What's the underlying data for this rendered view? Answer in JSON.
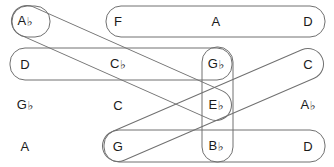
{
  "diagram": {
    "width": 334,
    "height": 167,
    "background": "#ffffff",
    "stroke_color": "#707070",
    "text_color": "#1a1a1a"
  },
  "grid": {
    "columns_x": [
      25,
      118,
      216,
      308
    ],
    "rows_y": [
      21,
      64,
      105,
      146
    ],
    "cells": [
      {
        "id": "r1c1",
        "label": "A♭",
        "text": "A",
        "accidental": "♭",
        "x": 25,
        "y": 21
      },
      {
        "id": "r1c2",
        "label": "F",
        "text": "F",
        "accidental": "",
        "x": 118,
        "y": 21
      },
      {
        "id": "r1c3",
        "label": "A",
        "text": "A",
        "accidental": "",
        "x": 216,
        "y": 21
      },
      {
        "id": "r1c4",
        "label": "D",
        "text": "D",
        "accidental": "",
        "x": 308,
        "y": 21
      },
      {
        "id": "r2c1",
        "label": "D",
        "text": "D",
        "accidental": "",
        "x": 25,
        "y": 64
      },
      {
        "id": "r2c2",
        "label": "C♭",
        "text": "C",
        "accidental": "♭",
        "x": 118,
        "y": 64
      },
      {
        "id": "r2c3",
        "label": "G♭",
        "text": "G",
        "accidental": "♭",
        "x": 216,
        "y": 64
      },
      {
        "id": "r2c4",
        "label": "C",
        "text": "C",
        "accidental": "",
        "x": 308,
        "y": 64
      },
      {
        "id": "r3c1",
        "label": "G♭",
        "text": "G",
        "accidental": "♭",
        "x": 25,
        "y": 105
      },
      {
        "id": "r3c2",
        "label": "C",
        "text": "C",
        "accidental": "",
        "x": 118,
        "y": 105
      },
      {
        "id": "r3c3",
        "label": "E♭",
        "text": "E",
        "accidental": "♭",
        "x": 216,
        "y": 105
      },
      {
        "id": "r3c4",
        "label": "A♭",
        "text": "A",
        "accidental": "♭",
        "x": 308,
        "y": 105
      },
      {
        "id": "r4c1",
        "label": "A",
        "text": "A",
        "accidental": "",
        "x": 25,
        "y": 146
      },
      {
        "id": "r4c2",
        "label": "G",
        "text": "G",
        "accidental": "",
        "x": 118,
        "y": 146
      },
      {
        "id": "r4c3",
        "label": "B♭",
        "text": "B",
        "accidental": "♭",
        "x": 216,
        "y": 146
      },
      {
        "id": "r4c4",
        "label": "D",
        "text": "D",
        "accidental": "",
        "x": 308,
        "y": 146
      }
    ]
  },
  "groupings": [
    {
      "id": "capsule-ab",
      "name": "capsule-row1-ab",
      "orientation": "single",
      "members": [
        "A♭"
      ],
      "shape": "rounded-rect",
      "x": 12,
      "y": 6,
      "w": 38,
      "h": 31,
      "r": 15
    },
    {
      "id": "capsule-f-a-d",
      "name": "capsule-row1-f-a-d",
      "orientation": "horizontal",
      "members": [
        "F",
        "A",
        "D"
      ],
      "shape": "rounded-rect",
      "x": 106,
      "y": 6,
      "w": 219,
      "h": 31,
      "r": 15
    },
    {
      "id": "capsule-d-cb-gb",
      "name": "capsule-row2-d-cb-gb",
      "orientation": "horizontal",
      "members": [
        "D",
        "C♭",
        "G♭"
      ],
      "shape": "rounded-rect",
      "x": 10,
      "y": 48,
      "w": 222,
      "h": 32,
      "r": 15
    },
    {
      "id": "capsule-g-bb-d",
      "name": "capsule-row4-g-bb-d",
      "orientation": "horizontal",
      "members": [
        "G",
        "B♭",
        "D"
      ],
      "shape": "rounded-rect",
      "x": 104,
      "y": 130,
      "w": 221,
      "h": 32,
      "r": 15
    },
    {
      "id": "capsule-gb-eb-bb",
      "name": "capsule-column-gb-eb-bb",
      "orientation": "vertical",
      "members": [
        "G♭",
        "E♭",
        "B♭"
      ],
      "shape": "rounded-rect",
      "x": 202,
      "y": 47,
      "w": 31,
      "h": 115,
      "r": 15
    },
    {
      "id": "capsule-diag-ab-eb",
      "name": "capsule-diagonal-ab-to-eb",
      "orientation": "diagonal-down",
      "members": [
        "A♭",
        "E♭"
      ],
      "shape": "rotated-capsule",
      "x1": 27,
      "y1": 21,
      "x2": 216,
      "y2": 105,
      "thickness": 31
    },
    {
      "id": "capsule-diag-g-c",
      "name": "capsule-diagonal-g-to-c",
      "orientation": "diagonal-up",
      "members": [
        "G",
        "C"
      ],
      "shape": "rotated-capsule",
      "x1": 118,
      "y1": 146,
      "x2": 308,
      "y2": 64,
      "thickness": 31
    }
  ]
}
